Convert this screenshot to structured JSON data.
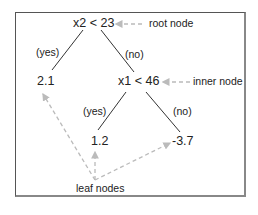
{
  "diagram": {
    "type": "decision-tree",
    "root": {
      "condition": "x2 < 23",
      "annotation": "root node"
    },
    "root_edges": {
      "yes": "(yes)",
      "no": "(no)"
    },
    "left_leaf": {
      "value": "2.1"
    },
    "inner": {
      "condition": "x1 < 46",
      "annotation": "inner node"
    },
    "inner_edges": {
      "yes": "(yes)",
      "no": "(no)"
    },
    "inner_left_leaf": {
      "value": "1.2"
    },
    "inner_right_leaf": {
      "value": "-3.7"
    },
    "leaf_annotation": "leaf nodes",
    "colors": {
      "edge": "#333333",
      "annotation_arrow": "#bbbbbb",
      "frame": "#666666"
    }
  }
}
